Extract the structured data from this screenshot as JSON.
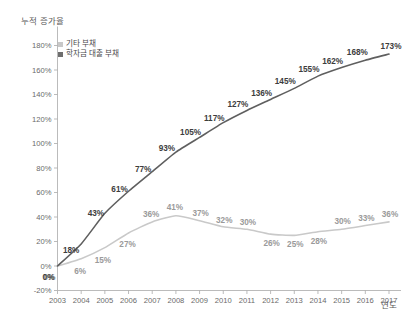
{
  "chart_data": {
    "type": "line",
    "title": "",
    "ylabel": "누적 증가율",
    "xlabel": "연도",
    "categories": [
      "2003",
      "2004",
      "2005",
      "2006",
      "2007",
      "2008",
      "2009",
      "2010",
      "2011",
      "2012",
      "2013",
      "2014",
      "2015",
      "2016",
      "2017"
    ],
    "ylim": [
      -20,
      180
    ],
    "ytick_labels": [
      "-20%",
      "0%",
      "20%",
      "40%",
      "60%",
      "80%",
      "100%",
      "120%",
      "140%",
      "160%",
      "180%"
    ],
    "ytick_values": [
      -20,
      0,
      20,
      40,
      60,
      80,
      100,
      120,
      140,
      160,
      180
    ],
    "grid": false,
    "legend_position": "top-left",
    "series": [
      {
        "name": "기타 부채",
        "color": "#c9c9c9",
        "values": [
          0,
          6,
          15,
          27,
          36,
          41,
          37,
          32,
          30,
          26,
          25,
          28,
          30,
          33,
          36
        ],
        "labels": [
          "0%",
          "6%",
          "15%",
          "27%",
          "36%",
          "41%",
          "37%",
          "32%",
          "30%",
          "26%",
          "25%",
          "28%",
          "30%",
          "33%",
          "36%"
        ]
      },
      {
        "name": "학자금 대출 부채",
        "color": "#5f5f5f",
        "values": [
          0,
          18,
          43,
          61,
          77,
          93,
          105,
          117,
          127,
          136,
          145,
          155,
          162,
          168,
          173
        ],
        "labels": [
          "0%",
          "18%",
          "43%",
          "61%",
          "77%",
          "93%",
          "105%",
          "117%",
          "127%",
          "136%",
          "145%",
          "155%",
          "162%",
          "168%",
          "173%"
        ]
      }
    ]
  },
  "legend": {
    "items": [
      {
        "label": "기타 부채",
        "swatch": "light-gray"
      },
      {
        "label": "학자금 대출 부채",
        "swatch": "dark-gray"
      }
    ]
  },
  "axes": {
    "y_title": "누적 증가율",
    "x_title": "연도"
  }
}
